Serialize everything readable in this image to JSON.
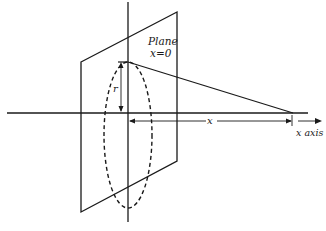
{
  "diagram": {
    "plane_label_line1": "Plane",
    "plane_label_line2": "x=0",
    "radius_label": "r",
    "distance_label": "x",
    "axis_label": "x axis",
    "line_color": "#1a1a1a"
  }
}
